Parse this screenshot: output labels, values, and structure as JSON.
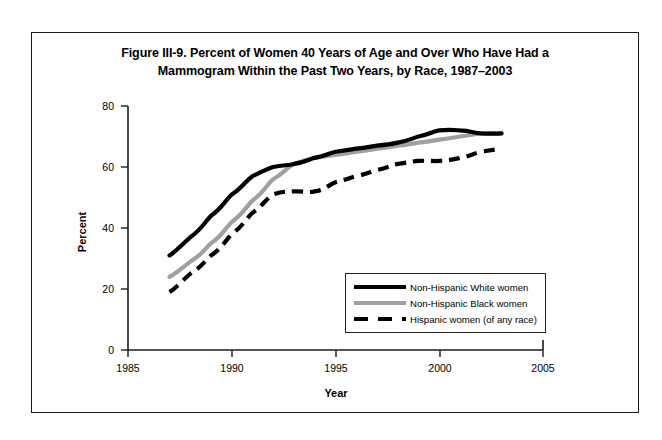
{
  "figure": {
    "title_line1": "Figure III-9. Percent of Women 40 Years of Age and Over Who Have Had a",
    "title_line2": "Mammogram Within the Past Two Years, by Race, 1987–2003"
  },
  "axes": {
    "x_title": "Year",
    "y_title": "Percent",
    "x_ticks": [
      "1985",
      "1990",
      "1995",
      "2000",
      "2005"
    ],
    "y_ticks": [
      "0",
      "20",
      "40",
      "60",
      "80"
    ]
  },
  "legend": {
    "items": [
      {
        "label": "Non-Hispanic White women",
        "style": "solid",
        "color": "#000000",
        "swatch": "sw-solid-black"
      },
      {
        "label": "Non-Hispanic Black women",
        "style": "solid",
        "color": "#a0a0a0",
        "swatch": "sw-solid-gray"
      },
      {
        "label": "Hispanic women (of any race)",
        "style": "dashed",
        "color": "#000000",
        "swatch": "sw-dashed"
      }
    ]
  },
  "chart_data": {
    "type": "line",
    "title": "Figure III-9. Percent of Women 40 Years of Age and Over Who Have Had a Mammogram Within the Past Two Years, by Race, 1987–2003",
    "xlabel": "Year",
    "ylabel": "Percent",
    "xlim": [
      1985,
      2005
    ],
    "ylim": [
      0,
      80
    ],
    "xticks": [
      1985,
      1990,
      1995,
      2000,
      2005
    ],
    "yticks": [
      0,
      20,
      40,
      60,
      80
    ],
    "grid": false,
    "legend_position": "inside-lower-right",
    "x": [
      1987,
      1988,
      1989,
      1990,
      1991,
      1992,
      1993,
      1994,
      1995,
      1996,
      1997,
      1998,
      1999,
      2000,
      2001,
      2002,
      2003
    ],
    "series": [
      {
        "name": "Non-Hispanic White women",
        "color": "#000000",
        "style": "solid",
        "values": [
          31,
          37,
          44,
          51,
          57,
          60,
          61,
          63,
          65,
          66,
          67,
          68,
          70,
          72,
          72,
          71,
          71
        ]
      },
      {
        "name": "Non-Hispanic Black women",
        "color": "#a0a0a0",
        "style": "solid",
        "values": [
          24,
          29,
          35,
          42,
          49,
          56,
          61,
          63,
          64,
          65,
          66,
          67,
          68,
          69,
          70,
          71,
          71
        ]
      },
      {
        "name": "Hispanic women (of any race)",
        "color": "#000000",
        "style": "dashed",
        "values": [
          19,
          25,
          31,
          38,
          45,
          51,
          52,
          52,
          55,
          57,
          59,
          61,
          62,
          62,
          63,
          65,
          66
        ]
      }
    ]
  }
}
